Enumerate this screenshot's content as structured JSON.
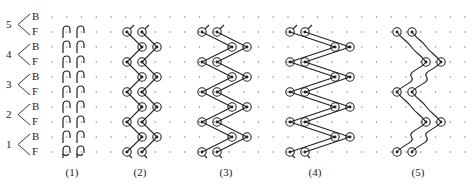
{
  "figure": {
    "row_labels": [
      {
        "course": "5",
        "top": "B",
        "bottom": "F"
      },
      {
        "course": "4",
        "top": "B",
        "bottom": "F"
      },
      {
        "course": "3",
        "top": "B",
        "bottom": "F"
      },
      {
        "course": "2",
        "top": "B",
        "bottom": "F"
      },
      {
        "course": "1",
        "top": "B",
        "bottom": "F"
      }
    ],
    "captions": [
      "(1)",
      "(2)",
      "(3)",
      "(4)",
      "(5)"
    ],
    "grid": {
      "rows_y": [
        17,
        32,
        47,
        62,
        77,
        92,
        107,
        122,
        137,
        152
      ],
      "col_start_x": 52,
      "col_spacing": 14.75,
      "col_count": 29
    },
    "patterns": [
      {
        "id": 1,
        "type": "vertical-hooks",
        "cols_x": [
          66,
          80
        ]
      },
      {
        "id": 2,
        "type": "zigzag",
        "loop_x": [
          127,
          142
        ],
        "zig_x": [
          142,
          157
        ]
      },
      {
        "id": 3,
        "type": "zigzag",
        "loop_x": [
          202,
          217
        ],
        "zig_x": [
          232,
          247
        ]
      },
      {
        "id": 4,
        "type": "zigzag",
        "loop_x": [
          290,
          305
        ],
        "zig_x": [
          335,
          350
        ]
      },
      {
        "id": 5,
        "type": "wavy",
        "loop_x": [
          397,
          412
        ],
        "alt_x": [
          426,
          441
        ]
      }
    ],
    "colors": {
      "ink": "#222222",
      "dot": "#777777"
    }
  }
}
